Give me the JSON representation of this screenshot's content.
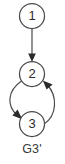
{
  "figure": {
    "caption": "G3'",
    "type": "directed-graph",
    "background_color": "#ffffff",
    "stroke_color": "#4a4a4a",
    "text_color": "#2b2b2b"
  },
  "graph": {
    "nodes": [
      {
        "id": "1",
        "label": "1",
        "cx": 32,
        "cy": 16,
        "r": 12.5
      },
      {
        "id": "2",
        "label": "2",
        "cx": 32,
        "cy": 74,
        "r": 12.5
      },
      {
        "id": "3",
        "label": "3",
        "cx": 32,
        "cy": 124,
        "r": 12.5
      }
    ],
    "edges": [
      {
        "from": "1",
        "to": "2",
        "style": "straight",
        "direction": "down"
      },
      {
        "from": "2",
        "to": "3",
        "style": "curved-left",
        "direction": "down"
      },
      {
        "from": "3",
        "to": "2",
        "style": "curved-right",
        "direction": "up"
      }
    ]
  }
}
